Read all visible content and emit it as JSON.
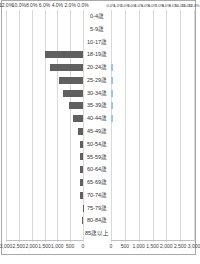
{
  "window": {
    "title": "年齢階級別グラフ"
  },
  "chart_data": {
    "type": "bar",
    "subtype": "population-pyramid-butterfly",
    "title": "",
    "grid": true,
    "legend_position": "none",
    "categories": [
      "0-4歳",
      "5-9歳",
      "10-17歳",
      "18-19歳",
      "20-24歳",
      "25-29歳",
      "30-34歳",
      "35-39歳",
      "40-44歳",
      "45-49歳",
      "50-54歳",
      "55-59歳",
      "60-64歳",
      "65-69歳",
      "70-74歳",
      "75-79歳",
      "80-84歳",
      "85歳以上"
    ],
    "series": [
      {
        "name": "left-count-bars",
        "side": "left",
        "color": "#606060",
        "values": [
          0,
          0,
          0,
          1500,
          1300,
          950,
          780,
          550,
          380,
          180,
          100,
          110,
          110,
          110,
          100,
          20,
          60,
          0
        ]
      },
      {
        "name": "right-count-bars",
        "side": "right",
        "color": "#9DC3E6",
        "values": [
          0,
          0,
          0,
          0,
          80,
          80,
          80,
          80,
          80,
          0,
          0,
          0,
          0,
          0,
          0,
          0,
          0,
          0
        ]
      }
    ],
    "axes": {
      "count_max": 3000,
      "top_left_percent": [
        "12.0%",
        "10.0%",
        "8.0%",
        "6.0%",
        "4.0%",
        "2.0%",
        "0.0%"
      ],
      "top_right_percent": [
        "0.0%",
        "1.0%",
        "2.0%",
        "3.0%",
        "4.0%",
        "5.0%",
        "6.0%",
        "7.0%",
        "8.0%",
        "9.0%",
        "10.0%",
        "11.0%",
        "12.0%"
      ],
      "bottom_left_count": [
        "3,000",
        "2,500",
        "2,000",
        "1,500",
        "1,000",
        "500",
        "0"
      ],
      "bottom_right_count": [
        "0",
        "500",
        "1,000",
        "1,500",
        "2,000",
        "2,500",
        "3,000"
      ]
    },
    "colors": {
      "left_bar": "#606060",
      "right_bar": "#9DC3E6",
      "gridline": "#d9d9d9",
      "axis_line": "#bfbfbf",
      "frame_border": "#a9a9a9",
      "text": "#404040"
    }
  }
}
